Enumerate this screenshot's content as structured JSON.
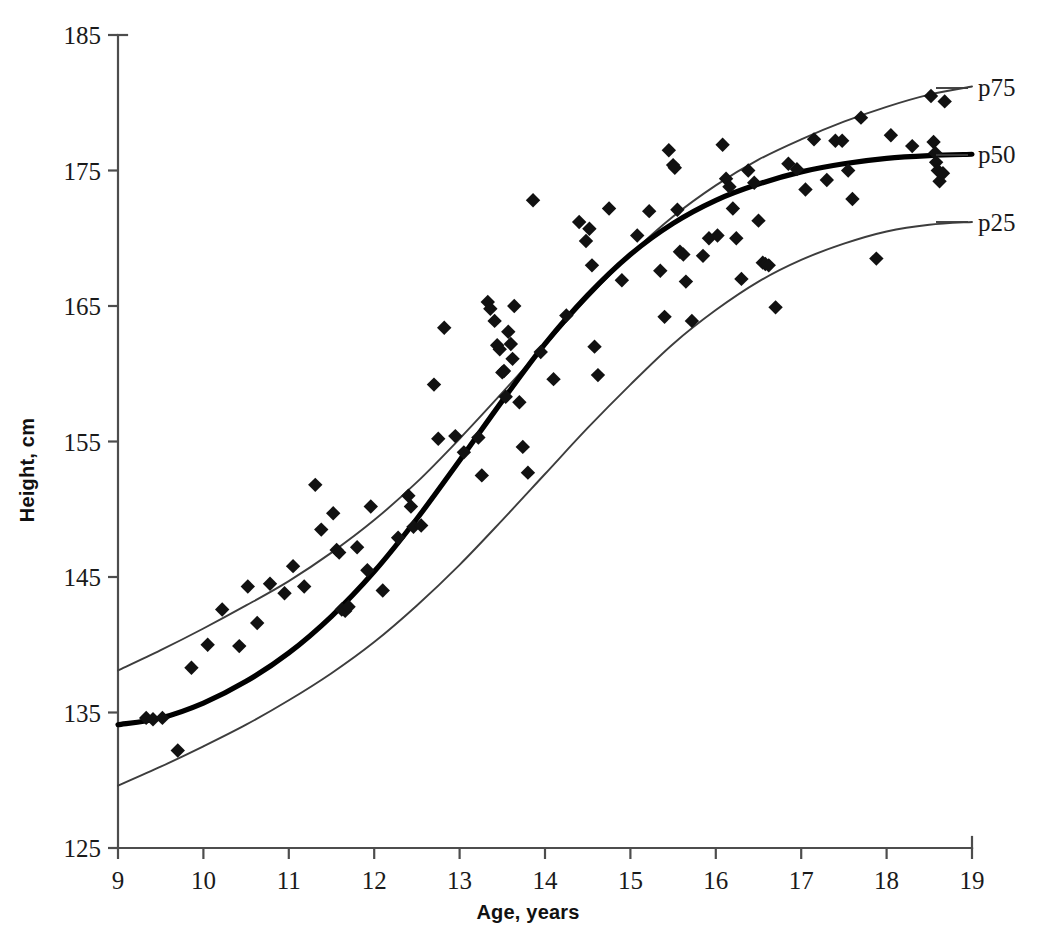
{
  "chart_data": {
    "type": "scatter",
    "title": "",
    "xlabel": "Age, years",
    "ylabel": "Height, cm",
    "xlim": [
      9,
      19
    ],
    "ylim": [
      125,
      185
    ],
    "xticks": [
      9,
      10,
      11,
      12,
      13,
      14,
      15,
      16,
      17,
      18,
      19
    ],
    "yticks": [
      125,
      135,
      145,
      155,
      165,
      175,
      185
    ],
    "grid": false,
    "legend_position": "right-inline-labels",
    "point_marker": "diamond",
    "point_color": "#111111",
    "curve_color": "#3d3d3d",
    "median_curve_color": "#000000",
    "series": [
      {
        "name": "p75",
        "label": "p75",
        "type": "line",
        "x": [
          9.0,
          9.5,
          10.0,
          10.5,
          11.0,
          11.5,
          12.0,
          12.5,
          13.0,
          13.5,
          14.0,
          14.5,
          15.0,
          15.5,
          16.0,
          16.5,
          17.0,
          17.5,
          18.0,
          18.5,
          19.0
        ],
        "y": [
          138.1,
          139.6,
          141.2,
          142.9,
          144.7,
          146.8,
          149.2,
          152.0,
          155.2,
          158.6,
          162.1,
          165.6,
          168.8,
          171.6,
          173.9,
          175.8,
          177.3,
          178.6,
          179.7,
          180.6,
          181.2
        ]
      },
      {
        "name": "p50",
        "label": "p50",
        "type": "line",
        "emphasis": true,
        "x": [
          9.0,
          9.5,
          10.0,
          10.5,
          11.0,
          11.5,
          12.0,
          12.5,
          13.0,
          13.5,
          14.0,
          14.5,
          15.0,
          15.5,
          16.0,
          16.5,
          17.0,
          17.5,
          18.0,
          18.5,
          19.0
        ],
        "y": [
          134.1,
          134.6,
          135.7,
          137.3,
          139.4,
          142.1,
          145.4,
          149.3,
          153.6,
          158.0,
          162.2,
          165.8,
          168.8,
          171.1,
          172.8,
          174.0,
          174.9,
          175.5,
          175.9,
          176.1,
          176.2
        ]
      },
      {
        "name": "p25",
        "label": "p25",
        "type": "line",
        "x": [
          9.0,
          9.5,
          10.0,
          10.5,
          11.0,
          11.5,
          12.0,
          12.5,
          13.0,
          13.5,
          14.0,
          14.5,
          15.0,
          15.5,
          16.0,
          16.5,
          17.0,
          17.5,
          18.0,
          18.5,
          19.0
        ],
        "y": [
          129.6,
          131.0,
          132.5,
          134.1,
          135.9,
          137.9,
          140.2,
          142.9,
          145.9,
          149.2,
          152.6,
          156.0,
          159.2,
          162.2,
          164.7,
          166.8,
          168.4,
          169.6,
          170.5,
          171.0,
          171.2
        ]
      },
      {
        "name": "observations",
        "label": "Observed heights",
        "type": "scatter",
        "points": [
          [
            9.33,
            134.6
          ],
          [
            9.41,
            134.5
          ],
          [
            9.52,
            134.6
          ],
          [
            9.7,
            132.2
          ],
          [
            9.86,
            138.3
          ],
          [
            10.05,
            140.0
          ],
          [
            10.22,
            142.6
          ],
          [
            10.42,
            139.9
          ],
          [
            10.52,
            144.3
          ],
          [
            10.63,
            141.6
          ],
          [
            10.78,
            144.5
          ],
          [
            10.95,
            143.8
          ],
          [
            11.05,
            145.8
          ],
          [
            11.18,
            144.3
          ],
          [
            11.31,
            151.8
          ],
          [
            11.38,
            148.5
          ],
          [
            11.52,
            149.7
          ],
          [
            11.56,
            147.0
          ],
          [
            11.59,
            146.8
          ],
          [
            11.62,
            142.6
          ],
          [
            11.66,
            142.5
          ],
          [
            11.7,
            142.8
          ],
          [
            11.8,
            147.2
          ],
          [
            11.92,
            145.5
          ],
          [
            11.96,
            150.2
          ],
          [
            12.1,
            144.0
          ],
          [
            12.28,
            147.9
          ],
          [
            12.4,
            151.0
          ],
          [
            12.43,
            150.2
          ],
          [
            12.46,
            148.7
          ],
          [
            12.55,
            148.8
          ],
          [
            12.7,
            159.2
          ],
          [
            12.75,
            155.2
          ],
          [
            12.82,
            163.4
          ],
          [
            12.95,
            155.4
          ],
          [
            13.05,
            154.2
          ],
          [
            13.22,
            155.3
          ],
          [
            13.26,
            152.5
          ],
          [
            13.33,
            165.3
          ],
          [
            13.36,
            164.8
          ],
          [
            13.41,
            163.9
          ],
          [
            13.44,
            162.1
          ],
          [
            13.47,
            161.8
          ],
          [
            13.5,
            160.1
          ],
          [
            13.52,
            160.2
          ],
          [
            13.54,
            158.3
          ],
          [
            13.57,
            163.1
          ],
          [
            13.6,
            162.2
          ],
          [
            13.62,
            161.1
          ],
          [
            13.64,
            165.0
          ],
          [
            13.7,
            157.9
          ],
          [
            13.74,
            154.6
          ],
          [
            13.8,
            152.7
          ],
          [
            13.86,
            172.8
          ],
          [
            13.95,
            161.6
          ],
          [
            14.1,
            159.6
          ],
          [
            14.25,
            164.3
          ],
          [
            14.4,
            171.2
          ],
          [
            14.48,
            169.8
          ],
          [
            14.52,
            170.7
          ],
          [
            14.55,
            168.0
          ],
          [
            14.58,
            162.0
          ],
          [
            14.62,
            159.9
          ],
          [
            14.75,
            172.2
          ],
          [
            14.9,
            166.9
          ],
          [
            15.08,
            170.2
          ],
          [
            15.22,
            172.0
          ],
          [
            15.35,
            167.6
          ],
          [
            15.4,
            164.2
          ],
          [
            15.45,
            176.5
          ],
          [
            15.5,
            175.4
          ],
          [
            15.52,
            175.2
          ],
          [
            15.55,
            172.1
          ],
          [
            15.58,
            169.0
          ],
          [
            15.62,
            168.8
          ],
          [
            15.65,
            166.8
          ],
          [
            15.72,
            163.9
          ],
          [
            15.85,
            168.7
          ],
          [
            15.92,
            170.0
          ],
          [
            16.02,
            170.2
          ],
          [
            16.08,
            176.9
          ],
          [
            16.12,
            174.4
          ],
          [
            16.16,
            173.8
          ],
          [
            16.2,
            172.2
          ],
          [
            16.24,
            170.0
          ],
          [
            16.3,
            167.0
          ],
          [
            16.38,
            175.0
          ],
          [
            16.45,
            174.1
          ],
          [
            16.5,
            171.3
          ],
          [
            16.55,
            168.2
          ],
          [
            16.58,
            168.1
          ],
          [
            16.62,
            168.0
          ],
          [
            16.7,
            164.9
          ],
          [
            16.85,
            175.5
          ],
          [
            16.95,
            175.1
          ],
          [
            17.05,
            173.6
          ],
          [
            17.15,
            177.3
          ],
          [
            17.3,
            174.3
          ],
          [
            17.4,
            177.2
          ],
          [
            17.48,
            177.2
          ],
          [
            17.55,
            175.0
          ],
          [
            17.6,
            172.9
          ],
          [
            17.7,
            178.9
          ],
          [
            17.88,
            168.5
          ],
          [
            18.05,
            177.6
          ],
          [
            18.3,
            176.8
          ],
          [
            18.52,
            180.5
          ],
          [
            18.55,
            177.1
          ],
          [
            18.57,
            176.3
          ],
          [
            18.58,
            175.6
          ],
          [
            18.6,
            175.0
          ],
          [
            18.62,
            174.2
          ],
          [
            18.66,
            174.8
          ],
          [
            18.68,
            180.1
          ]
        ]
      }
    ]
  },
  "axes": {
    "x_title": "Age, years",
    "y_title": "Height, cm",
    "x_tick_labels": [
      "9",
      "10",
      "11",
      "12",
      "13",
      "14",
      "15",
      "16",
      "17",
      "18",
      "19"
    ],
    "y_tick_labels": [
      "125",
      "135",
      "145",
      "155",
      "165",
      "175",
      "185"
    ]
  },
  "annotations": {
    "p75_label": "p75",
    "p50_label": "p50",
    "p25_label": "p25"
  }
}
